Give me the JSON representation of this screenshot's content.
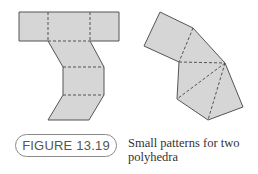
{
  "figure": {
    "label": "FIGURE 13.19",
    "caption": "Small patterns for two polyhedra",
    "colors": {
      "fill": "#d6d6d6",
      "stroke": "#555555",
      "badge_border": "#8a8a8a",
      "badge_text": "#555555"
    },
    "left_net": {
      "description": "Net of faces: top row of three rectangles, then two parallelograms and a rectangle stacked in zig-zag"
    },
    "right_net": {
      "description": "Net of one square attached to a fan of triangles sharing a common apex"
    }
  }
}
